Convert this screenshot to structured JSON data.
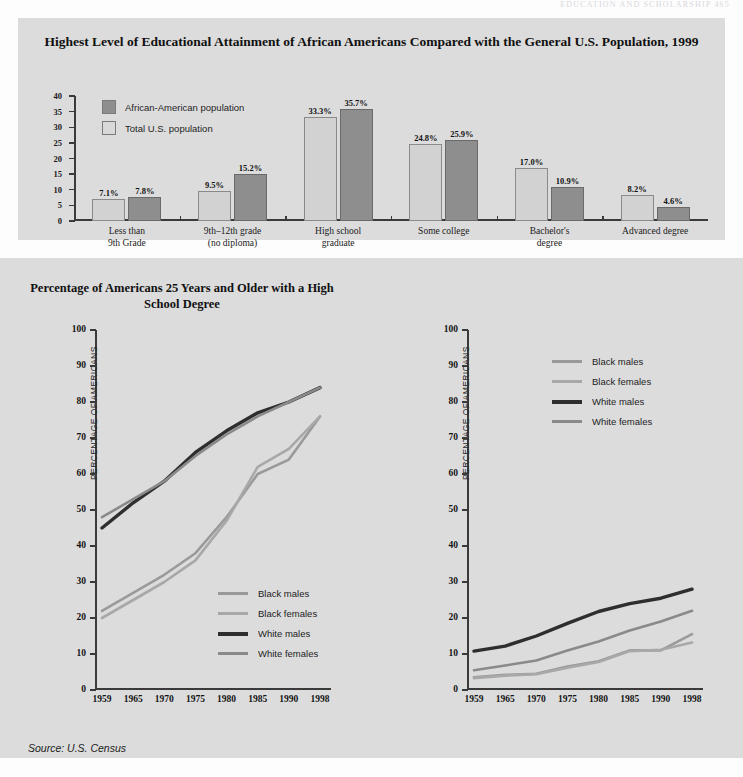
{
  "running_head": "EDUCATION AND SCHOLARSHIP   465",
  "source_note": "Source: U.S. Census",
  "bar_chart": {
    "title": "Highest Level of Educational Attainment of African Americans\nCompared with the General U.S. Population, 1999",
    "legend": [
      {
        "label": "African-American population",
        "swatch": "dark",
        "color": "#8e8e8e"
      },
      {
        "label": "Total U.S. population",
        "swatch": "light",
        "color": "#d8d8d8"
      }
    ]
  },
  "hs_chart": {
    "title": "Percentage of Americans 25 Years and Older\nwith a High School Degree",
    "ylabel": "PERCENTAGE OF AMERICANS"
  },
  "col_chart": {
    "title": "Percentage of Americans 25 Years and Older\nwith a College Degree",
    "ylabel": "PERCENTAGE OF AMERICANS"
  },
  "chart_data": [
    {
      "type": "bar",
      "title": "Highest Level of Educational Attainment of African Americans Compared with the General U.S. Population, 1999",
      "xlabel": "",
      "ylabel": "",
      "ylim": [
        0,
        40
      ],
      "yticks": [
        0,
        5,
        10,
        15,
        20,
        25,
        30,
        35,
        40
      ],
      "grid": false,
      "legend_position": "upper-left",
      "categories": [
        "Less than\n9th Grade",
        "9th–12th grade\n(no diploma)",
        "High school\ngraduate",
        "Some college",
        "Bachelor's\ndegree",
        "Advanced degree"
      ],
      "series": [
        {
          "name": "Total U.S. population",
          "color": "#d2d2d2",
          "values": [
            7.1,
            9.5,
            33.3,
            24.8,
            17.0,
            8.2
          ],
          "labels": [
            "7.1%",
            "9.5%",
            "33.3%",
            "24.8%",
            "17.0%",
            "8.2%"
          ]
        },
        {
          "name": "African-American population",
          "color": "#8e8e8e",
          "values": [
            7.8,
            15.2,
            35.7,
            25.9,
            10.9,
            4.6
          ],
          "labels": [
            "7.8%",
            "15.2%",
            "35.7%",
            "25.9%",
            "10.9%",
            "4.6%"
          ]
        }
      ]
    },
    {
      "type": "line",
      "title": "Percentage of Americans 25 Years and Older with a High School Degree",
      "xlabel": "",
      "ylabel": "PERCENTAGE OF AMERICANS",
      "ylim": [
        0,
        100
      ],
      "yticks": [
        0,
        10,
        20,
        30,
        40,
        50,
        60,
        70,
        80,
        90,
        100
      ],
      "x": [
        1959,
        1965,
        1970,
        1975,
        1980,
        1985,
        1990,
        1998
      ],
      "grid": false,
      "legend_position": "lower-right",
      "series": [
        {
          "name": "Black males",
          "color": "#9a9a9a",
          "width": 2.6,
          "values": [
            22,
            27,
            32,
            38,
            48,
            60,
            64,
            76
          ]
        },
        {
          "name": "Black females",
          "color": "#a8a8a8",
          "width": 2.6,
          "values": [
            20,
            25,
            30,
            36,
            47,
            62,
            67,
            76
          ]
        },
        {
          "name": "White males",
          "color": "#2e2e2e",
          "width": 3.4,
          "values": [
            45,
            52,
            58,
            66,
            72,
            77,
            80,
            84
          ]
        },
        {
          "name": "White females",
          "color": "#8a8a8a",
          "width": 2.6,
          "values": [
            48,
            53,
            58,
            65,
            71,
            76,
            80,
            84
          ]
        }
      ]
    },
    {
      "type": "line",
      "title": "Percentage of Americans 25 Years and Older with a College Degree",
      "xlabel": "",
      "ylabel": "PERCENTAGE OF AMERICANS",
      "ylim": [
        0,
        100
      ],
      "yticks": [
        0,
        10,
        20,
        30,
        40,
        50,
        60,
        70,
        80,
        90,
        100
      ],
      "x": [
        1959,
        1965,
        1970,
        1975,
        1980,
        1985,
        1990,
        1998
      ],
      "grid": false,
      "legend_position": "upper-right",
      "series": [
        {
          "name": "Black males",
          "color": "#9a9a9a",
          "width": 2.6,
          "values": [
            3.5,
            4.2,
            4.5,
            6.5,
            8.0,
            11.0,
            11.0,
            15.5
          ]
        },
        {
          "name": "Black females",
          "color": "#a8a8a8",
          "width": 2.6,
          "values": [
            3.3,
            4.0,
            4.4,
            6.2,
            7.8,
            10.8,
            11.2,
            13.2
          ]
        },
        {
          "name": "White males",
          "color": "#2e2e2e",
          "width": 3.4,
          "values": [
            10.8,
            12.2,
            15.0,
            18.5,
            21.8,
            24.0,
            25.5,
            28.0
          ]
        },
        {
          "name": "White females",
          "color": "#8a8a8a",
          "width": 2.6,
          "values": [
            5.5,
            6.8,
            8.2,
            11.0,
            13.5,
            16.5,
            19.0,
            22.0
          ]
        }
      ]
    }
  ]
}
